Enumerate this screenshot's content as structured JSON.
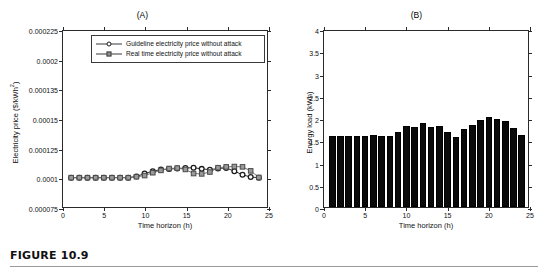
{
  "figure": {
    "caption": "FIGURE 10.9"
  },
  "chart_data": [
    {
      "type": "line",
      "panel_id": "A",
      "title": "(A)",
      "xlabel": "Time horizon (h)",
      "ylabel": "Electricity price ($/kWh",
      "ylabel_sup": "2",
      "ylabel_tail": ")",
      "xlim": [
        0,
        25
      ],
      "ylim": [
        7.5e-05,
        0.000225
      ],
      "grid": false,
      "legend_position": "top-center-inside",
      "xticks": [
        0,
        5,
        10,
        15,
        20,
        25
      ],
      "xticklabels": [
        "0",
        "5",
        "10",
        "15",
        "20",
        "25"
      ],
      "yticks": [
        7.5e-05,
        0.0001,
        0.000125,
        0.00015,
        0.000135,
        0.0002,
        0.000225
      ],
      "yticklabels": [
        "0.000075",
        "0.0001",
        "0.000125",
        "0.00015",
        "0.000135",
        "0.0002",
        "0.000225"
      ],
      "x": [
        1,
        2,
        3,
        4,
        5,
        6,
        7,
        8,
        9,
        10,
        11,
        12,
        13,
        14,
        15,
        16,
        17,
        18,
        19,
        20,
        21,
        22,
        23,
        24
      ],
      "series": [
        {
          "name": "Guideline electricity price without attack",
          "marker": "circle",
          "color": "#1c1c1c",
          "values": [
            0.0001,
            0.0001,
            0.0001,
            0.0001,
            0.0001,
            0.0001,
            0.0001,
            0.0001,
            0.000101,
            0.0001035,
            0.0001055,
            0.000107,
            0.0001073,
            0.0001078,
            0.0001082,
            0.0001085,
            0.0001075,
            0.0001068,
            0.0001078,
            0.0001083,
            0.0001055,
            0.0001025,
            0.0001005,
            0.0001
          ]
        },
        {
          "name": "Real time electricity price without attack",
          "marker": "square",
          "color": "#8e8e8e",
          "values": [
            0.0001,
            0.0001,
            0.0001,
            0.0001,
            0.0001,
            0.0001,
            0.0001,
            0.0001,
            0.0001008,
            0.0001018,
            0.0001042,
            0.0001062,
            0.0001078,
            0.0001082,
            0.000107,
            0.0001035,
            0.0001032,
            0.0001048,
            0.0001085,
            0.0001092,
            0.0001095,
            0.0001092,
            0.0001058,
            0.0001002
          ]
        }
      ]
    },
    {
      "type": "bar",
      "panel_id": "B",
      "title": "(B)",
      "xlabel": "Time horizon (h)",
      "ylabel": "Energy load (kWh)",
      "xlim": [
        0,
        25
      ],
      "ylim": [
        0,
        4
      ],
      "grid": false,
      "bar_color": "#0a0a0a",
      "xticks": [
        0,
        5,
        10,
        15,
        20,
        25
      ],
      "xticklabels": [
        "0",
        "5",
        "10",
        "15",
        "20",
        "25"
      ],
      "yticks": [
        0,
        0.5,
        1,
        1.5,
        2,
        2.5,
        3,
        3.5,
        4
      ],
      "yticklabels": [
        "0",
        "0.5",
        "1",
        "1.5",
        "2",
        "2.5",
        "3",
        "3.5",
        "4"
      ],
      "categories": [
        1,
        2,
        3,
        4,
        5,
        6,
        7,
        8,
        9,
        10,
        11,
        12,
        13,
        14,
        15,
        16,
        17,
        18,
        19,
        20,
        21,
        22,
        23,
        24
      ],
      "values": [
        1.6,
        1.6,
        1.6,
        1.59,
        1.59,
        1.62,
        1.59,
        1.59,
        1.68,
        1.83,
        1.8,
        1.89,
        1.8,
        1.82,
        1.68,
        1.57,
        1.75,
        1.84,
        1.96,
        2.02,
        1.98,
        1.93,
        1.78,
        1.62
      ]
    }
  ]
}
